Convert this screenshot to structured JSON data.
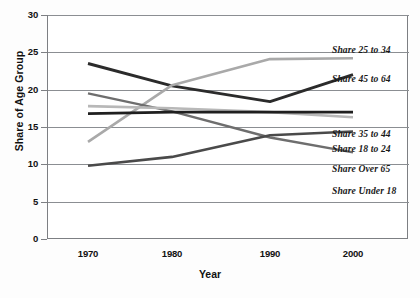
{
  "chart_data": {
    "type": "line",
    "title": "",
    "xlabel": "Year",
    "ylabel": "Share of Age Group",
    "x": [
      1970,
      1980,
      1990,
      2000
    ],
    "xticklabels": [
      "1970",
      "1980",
      "1990",
      "2000"
    ],
    "yticklabels": [
      "0",
      "5",
      "10",
      "15",
      "20",
      "25",
      "30"
    ],
    "yticks": [
      0,
      5,
      10,
      15,
      20,
      25,
      30
    ],
    "ylim": [
      0,
      30
    ],
    "xlim": [
      1965,
      2005
    ],
    "grid": "horizontal",
    "legend_position": "right-inline-annotations",
    "series": [
      {
        "name": "Share 45 to 64",
        "label": "Share 45 to 64",
        "color": "#2b2b2b",
        "width": 2.9,
        "values": [
          23.5,
          20.5,
          18.4,
          22.0
        ]
      },
      {
        "name": "Share 25 to 34",
        "label": "Share 25 to 34",
        "color": "#a9a9a9",
        "width": 2.6,
        "values": [
          13.0,
          20.6,
          24.1,
          24.2
        ]
      },
      {
        "name": "Share Under 18",
        "label": "Share Under 18",
        "color": "#6e6e6e",
        "width": 2.4,
        "values": [
          19.5,
          17.1,
          13.6,
          11.6
        ]
      },
      {
        "name": "Share 18 to 24",
        "label": "Share 18 to 24",
        "color": "#b8b8b8",
        "width": 2.6,
        "values": [
          17.8,
          17.5,
          17.0,
          16.3
        ]
      },
      {
        "name": "Share 35 to 44",
        "label": "Share 35 to 44",
        "color": "#1f1f1f",
        "width": 2.7,
        "values": [
          16.8,
          17.0,
          17.0,
          17.0
        ]
      },
      {
        "name": "Share Over 65",
        "label": "Share Over 65",
        "color": "#4a4a4a",
        "width": 2.6,
        "values": [
          9.8,
          11.0,
          13.9,
          14.4
        ]
      }
    ],
    "annotations": [
      {
        "text": "Share 25 to 34",
        "series": "Share 25 to 34"
      },
      {
        "text": "Share 45 to 64",
        "series": "Share 45 to 64"
      },
      {
        "text": "Share 35 to 44",
        "series": "Share 35 to 44"
      },
      {
        "text": "Share 18 to 24",
        "series": "Share 18 to 24"
      },
      {
        "text": "Share Over 65",
        "series": "Share Over 65"
      },
      {
        "text": "Share Under 18",
        "series": "Share Under 18"
      }
    ],
    "colors": {
      "frame": "#7d7f83",
      "grid": "#8b8e92",
      "background": "#ffffff"
    }
  }
}
